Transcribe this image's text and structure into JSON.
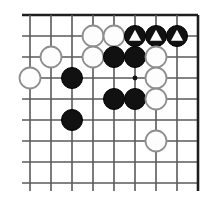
{
  "diagram": {
    "type": "go-board-diagram",
    "board": {
      "columns": 9,
      "rows": 9,
      "origin_x": 30,
      "origin_y": 15,
      "spacing": 21,
      "stone_radius": 10.5,
      "edges": {
        "top": true,
        "right": true,
        "bottom": false,
        "left": false
      },
      "line_color": "#5a5a5a",
      "edge_color": "#1e1e1e",
      "background_color": "#ffffff",
      "overhang": 8
    },
    "colors": {
      "black_stone": "#111111",
      "white_stone": "#fdfdfd",
      "white_stone_outline": "#8e8e8e",
      "marker": "#ffffff"
    },
    "star_points": [
      {
        "col": 5,
        "row": 3,
        "label": "star-point"
      }
    ],
    "stones": [
      {
        "col": 3,
        "row": 1,
        "color": "white",
        "marker": "none",
        "label": "white-stone-d8"
      },
      {
        "col": 4,
        "row": 1,
        "color": "white",
        "marker": "none",
        "label": "white-stone-e8"
      },
      {
        "col": 5,
        "row": 1,
        "color": "black",
        "marker": "triangle",
        "label": "black-stone-f8-triangle"
      },
      {
        "col": 6,
        "row": 1,
        "color": "black",
        "marker": "triangle",
        "label": "black-stone-g8-triangle"
      },
      {
        "col": 7,
        "row": 1,
        "color": "black",
        "marker": "triangle",
        "label": "black-stone-h8-triangle"
      },
      {
        "col": 1,
        "row": 2,
        "color": "white",
        "marker": "none",
        "label": "white-stone-b7"
      },
      {
        "col": 3,
        "row": 2,
        "color": "white",
        "marker": "none",
        "label": "white-stone-d7"
      },
      {
        "col": 4,
        "row": 2,
        "color": "black",
        "marker": "none",
        "label": "black-stone-e7"
      },
      {
        "col": 5,
        "row": 2,
        "color": "black",
        "marker": "none",
        "label": "black-stone-f7"
      },
      {
        "col": 6,
        "row": 2,
        "color": "white",
        "marker": "none",
        "label": "white-stone-g7"
      },
      {
        "col": 0,
        "row": 3,
        "color": "white",
        "marker": "none",
        "label": "white-stone-a6"
      },
      {
        "col": 2,
        "row": 3,
        "color": "black",
        "marker": "none",
        "label": "black-stone-c6"
      },
      {
        "col": 6,
        "row": 3,
        "color": "white",
        "marker": "none",
        "label": "white-stone-g6"
      },
      {
        "col": 4,
        "row": 4,
        "color": "black",
        "marker": "none",
        "label": "black-stone-e5"
      },
      {
        "col": 5,
        "row": 4,
        "color": "black",
        "marker": "none",
        "label": "black-stone-f5"
      },
      {
        "col": 6,
        "row": 4,
        "color": "white",
        "marker": "none",
        "label": "white-stone-g5"
      },
      {
        "col": 2,
        "row": 5,
        "color": "black",
        "marker": "none",
        "label": "black-stone-c4"
      },
      {
        "col": 6,
        "row": 6,
        "color": "white",
        "marker": "none",
        "label": "white-stone-g3"
      }
    ]
  }
}
